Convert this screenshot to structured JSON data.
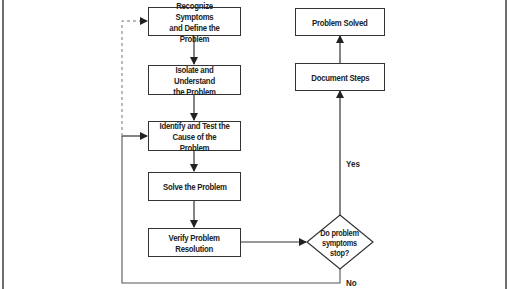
{
  "diagram": {
    "type": "flowchart",
    "nodes": {
      "recognize": {
        "label": "Recognize Symptoms\nand Define the Problem",
        "shape": "rect"
      },
      "isolate": {
        "label": "Isolate and Understand\nthe Problem",
        "shape": "rect"
      },
      "identify": {
        "label": "Identify and Test the\nCause of the Problem",
        "shape": "rect"
      },
      "solve": {
        "label": "Solve the Problem",
        "shape": "rect"
      },
      "verify": {
        "label": "Verify Problem\nResolution",
        "shape": "rect"
      },
      "decision": {
        "label": "Do problem\nsymptoms\nstop?",
        "shape": "diamond"
      },
      "document": {
        "label": "Document Steps",
        "shape": "rect"
      },
      "solved": {
        "label": "Problem Solved",
        "shape": "rect"
      }
    },
    "edges": [
      {
        "from": "recognize",
        "to": "isolate",
        "style": "solid"
      },
      {
        "from": "isolate",
        "to": "identify",
        "style": "solid"
      },
      {
        "from": "identify",
        "to": "solve",
        "style": "solid"
      },
      {
        "from": "solve",
        "to": "verify",
        "style": "solid"
      },
      {
        "from": "verify",
        "to": "decision",
        "style": "solid"
      },
      {
        "from": "decision",
        "to": "document",
        "label": "Yes",
        "style": "solid"
      },
      {
        "from": "document",
        "to": "solved",
        "style": "solid"
      },
      {
        "from": "decision",
        "to": "identify",
        "label": "No",
        "style": "solid"
      },
      {
        "from": "identify",
        "to": "recognize",
        "style": "dashed"
      }
    ],
    "edge_labels": {
      "yes": "Yes",
      "no": "No"
    },
    "colors": {
      "line": "#333333",
      "frame": "#6e6e6e",
      "dashed": "#777777",
      "background": "#ffffff"
    }
  }
}
